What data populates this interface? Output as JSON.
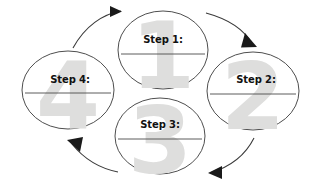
{
  "diagram": {
    "type": "cycle",
    "direction": "clockwise",
    "background_color": "#ffffff",
    "outline_color": "#3a3a3a",
    "watermark_color": "#dededd",
    "label_color": "#111111",
    "nodes": [
      {
        "id": "step-1",
        "label": "Step 1:",
        "watermark": "1",
        "position": "top",
        "cx": 163,
        "cy": 50,
        "rx": 45,
        "ry": 39,
        "label_x": 163,
        "label_y": 39,
        "rule_y": 54,
        "rule_half": 42,
        "wm_x": 163,
        "wm_y": 88
      },
      {
        "id": "step-2",
        "label": "Step 2:",
        "watermark": "2",
        "position": "right",
        "cx": 253,
        "cy": 91,
        "rx": 46,
        "ry": 39,
        "label_x": 256,
        "label_y": 79,
        "rule_y": 94,
        "rule_half": 43,
        "wm_x": 253,
        "wm_y": 129
      },
      {
        "id": "step-3",
        "label": "Step 3:",
        "watermark": "3",
        "position": "bottom",
        "cx": 160,
        "cy": 136,
        "rx": 45,
        "ry": 38,
        "label_x": 160,
        "label_y": 124,
        "rule_y": 139,
        "rule_half": 42,
        "wm_x": 160,
        "wm_y": 173
      },
      {
        "id": "step-4",
        "label": "Step 4:",
        "watermark": "4",
        "position": "left",
        "cx": 68,
        "cy": 90,
        "rx": 46,
        "ry": 39,
        "label_x": 70,
        "label_y": 79,
        "rule_y": 93,
        "rule_half": 43,
        "wm_x": 68,
        "wm_y": 128
      }
    ],
    "arrows": [
      {
        "id": "arrow-step4-to-step1",
        "from": "step-4",
        "to": "step-1",
        "path": "M 73,48 C 85,26 103,14 121,11",
        "head_points": "110,6 122,11.5 110,17",
        "head_rotate": -18
      },
      {
        "id": "arrow-step1-to-step2",
        "from": "step-1",
        "to": "step-2",
        "path": "M 206,13 C 228,19 244,29 252,44",
        "head_points": "245,34 256,47 240,48",
        "head_rotate": 0
      },
      {
        "id": "arrow-step2-to-step3",
        "from": "step-2",
        "to": "step-3",
        "path": "M 254,138 C 245,155 230,166 210,172",
        "head_points": "222,166 209,172.5 222,179",
        "head_rotate": 0
      },
      {
        "id": "arrow-step3-to-step4",
        "from": "step-3",
        "to": "step-4",
        "path": "M 118,172 C 98,167 84,158 72,143",
        "head_points": "80,152 68,140 84,138",
        "head_rotate": 0
      }
    ]
  }
}
